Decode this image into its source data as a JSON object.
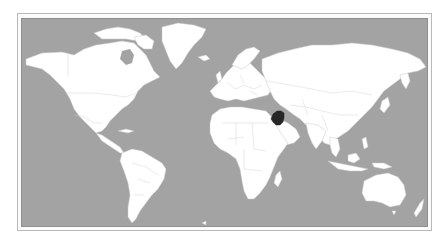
{
  "map": {
    "type": "world-political-locator",
    "projection": "equirectangular-like",
    "highlighted_country": "Iraq",
    "colors": {
      "ocean": "#a3a3a3",
      "land": "#ffffff",
      "borders": "#cfcfcf",
      "highlight": "#262626",
      "frame": "#b9b9b9"
    }
  }
}
